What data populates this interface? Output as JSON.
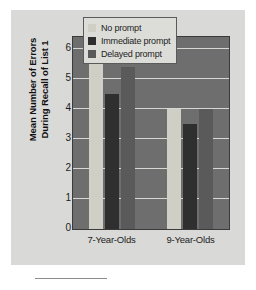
{
  "chart_data": {
    "type": "bar",
    "title": "",
    "xlabel": "",
    "ylabel": "Mean Number of Errors During Recall of List 1",
    "ylabel_line1": "Mean Number of Errors",
    "ylabel_line2": "During Recall of List 1",
    "categories": [
      "7-Year-Olds",
      "9-Year-Olds"
    ],
    "ylim": [
      0,
      6.4
    ],
    "yticks": [
      0,
      1,
      2,
      3,
      4,
      5,
      6
    ],
    "ytick_labels": [
      "0",
      "1",
      "2",
      "3",
      "4",
      "5",
      "6"
    ],
    "grid": true,
    "legend_position": "top-right",
    "series": [
      {
        "name": "No prompt",
        "color": "#cfcfc6",
        "values": [
          5.5,
          4.0
        ]
      },
      {
        "name": "Immediate prompt",
        "color": "#2f2f2f",
        "values": [
          4.5,
          3.5
        ]
      },
      {
        "name": "Delayed prompt",
        "color": "#5a5a5a",
        "values": [
          5.4,
          4.0
        ]
      }
    ]
  },
  "figure": {
    "background_color": "#d9d9d7",
    "plot_background_color": "#6e6e6e",
    "gridline_color": "#d6d6d2"
  }
}
